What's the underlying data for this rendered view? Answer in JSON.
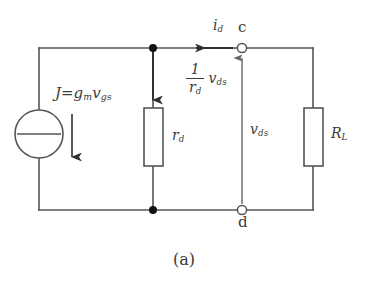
{
  "figure": {
    "caption": "(a)",
    "background_color": "#ffffff",
    "line_color": "#555555",
    "text_color": "#3a3a3a"
  },
  "labels": {
    "source": {
      "name": "J",
      "equals": "=",
      "expr_main": "g",
      "expr_main_sub": "m",
      "expr_second": "v",
      "expr_second_sub": "gs",
      "full": "J = g_m v_gs"
    },
    "rd_resistor": {
      "symbol": "r",
      "subscript": "d",
      "full": "r_d"
    },
    "branch_current": {
      "numerator": "1",
      "denominator_symbol": "r",
      "denominator_sub": "d",
      "factor_symbol": "v",
      "factor_sub": "ds",
      "full": "(1/r_d) v_ds"
    },
    "drain_current": {
      "symbol": "i",
      "subscript": "d",
      "full": "i_d"
    },
    "node_c": "c",
    "node_d": "d",
    "voltage": {
      "symbol": "v",
      "subscript": "ds",
      "full": "v_ds"
    },
    "load_resistor": {
      "symbol": "R",
      "subscript": "L",
      "full": "R_L"
    }
  },
  "components": [
    {
      "name": "dependent-current-source",
      "type": "current-source",
      "label": "J = g_m v_gs",
      "arrow_direction": "down"
    },
    {
      "name": "rd-resistor",
      "type": "resistor",
      "label": "r_d",
      "arrow_direction": "down"
    },
    {
      "name": "rl-resistor",
      "type": "resistor",
      "label": "R_L",
      "arrow_direction": "none"
    },
    {
      "name": "terminal-c",
      "type": "terminal",
      "label": "c"
    },
    {
      "name": "terminal-d",
      "type": "terminal",
      "label": "d"
    },
    {
      "name": "vds-arrow",
      "type": "voltage-arrow",
      "label": "v_ds",
      "arrow_direction": "up"
    },
    {
      "name": "id-arrow",
      "type": "current-arrow",
      "label": "i_d",
      "arrow_direction": "left"
    }
  ]
}
